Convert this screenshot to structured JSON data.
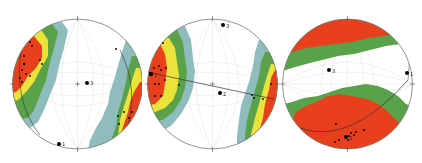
{
  "figure": {
    "type": "stereonet-density-contours",
    "panel_count": 3,
    "colors": {
      "red": "#e8401c",
      "yellow": "#ece33a",
      "green": "#5aa24a",
      "blue_gray": "#8fbcbc",
      "background": "#ffffff",
      "outline": "#777777",
      "grid": "#d6d6d6",
      "point": "#000000"
    },
    "contour_levels": [
      "blue_gray",
      "green",
      "yellow",
      "red"
    ]
  },
  "panels": [
    {
      "id": "panel-1",
      "axis_labels": [
        {
          "text": "3",
          "desc": "label next to large dot near center"
        },
        {
          "text": "1",
          "desc": "label next to large dot at bottom rim"
        }
      ]
    },
    {
      "id": "panel-2",
      "axis_labels": [
        {
          "text": "3",
          "desc": "label next to large dot near top"
        },
        {
          "text": "2",
          "desc": "label next to large dot on great-circle trace near center"
        },
        {
          "text": "1",
          "desc": "label next to large dot on left cluster"
        }
      ]
    },
    {
      "id": "panel-3",
      "axis_labels": [
        {
          "text": "3",
          "desc": "label next to large dot left of center"
        },
        {
          "text": "1",
          "desc": "label next to large dot at right rim"
        },
        {
          "text": "2",
          "desc": "label next to large dot in bottom cluster"
        }
      ]
    }
  ]
}
